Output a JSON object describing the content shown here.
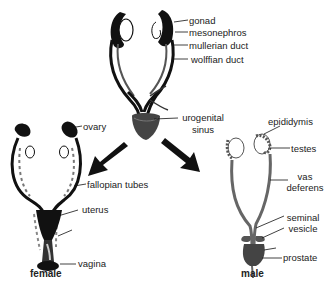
{
  "diagram": {
    "title": "",
    "stages": {
      "indifferent": {
        "labels": {
          "gonad": "gonad",
          "mesonephros": "mesonephros",
          "mullerian_duct": "mullerian duct",
          "wolffian_duct": "wolffian duct",
          "urogenital_sinus_1": "urogenital",
          "urogenital_sinus_2": "sinus"
        }
      },
      "female": {
        "caption": "female",
        "labels": {
          "ovary": "ovary",
          "fallopian_tubes": "fallopian tubes",
          "uterus": "uterus",
          "vagina": "vagina"
        }
      },
      "male": {
        "caption": "male",
        "labels": {
          "epididymis": "epididymis",
          "testes": "testes",
          "vas_deferens_1": "vas",
          "vas_deferens_2": "deferens",
          "seminal_vesicle_1": "seminal",
          "seminal_vesicle_2": "vesicle",
          "prostate": "prostate"
        }
      }
    },
    "arrows": [
      {
        "from": "indifferent",
        "to": "female"
      },
      {
        "from": "indifferent",
        "to": "male"
      }
    ]
  }
}
